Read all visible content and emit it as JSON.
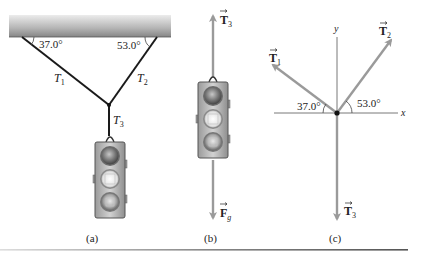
{
  "figure": {
    "panels": [
      {
        "id": "a",
        "caption": "(a)",
        "angle_left": "37.0°",
        "angle_right": "53.0°",
        "tension_labels": {
          "t1": "T",
          "t1_sub": "1",
          "t2": "T",
          "t2_sub": "2",
          "t3": "T",
          "t3_sub": "3"
        }
      },
      {
        "id": "b",
        "caption": "(b)",
        "force_up": {
          "symbol": "T",
          "sub": "3"
        },
        "force_down": {
          "symbol": "F",
          "sub": "g"
        }
      },
      {
        "id": "c",
        "caption": "(c)",
        "axis_x": "x",
        "axis_y": "y",
        "angle_t1": "37.0°",
        "angle_t2": "53.0°",
        "vectors": [
          {
            "symbol": "T",
            "sub": "1"
          },
          {
            "symbol": "T",
            "sub": "2"
          },
          {
            "symbol": "T",
            "sub": "3"
          }
        ]
      }
    ],
    "colors": {
      "rope": "#1a1a1a",
      "vector": "#9a9a9a",
      "axis": "#555555",
      "ceiling_top": "#e4e4e4",
      "ceiling_bottom": "#8a8a8a",
      "light_body": "#b8b8b8",
      "rule": "#6a6a6a"
    }
  }
}
